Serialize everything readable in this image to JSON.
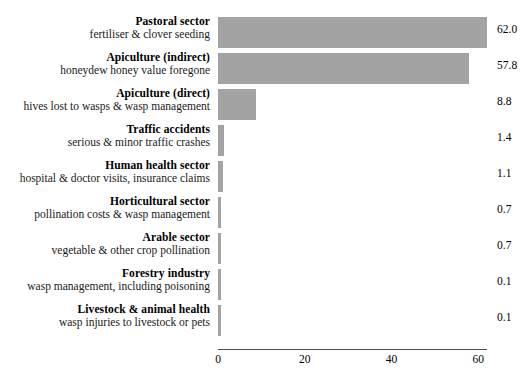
{
  "chart_data": {
    "type": "bar",
    "orientation": "horizontal",
    "title": "",
    "subtitle": "",
    "xlabel": "",
    "ylabel": "",
    "xlim": [
      0,
      62
    ],
    "xticks": [
      0,
      20,
      40,
      60
    ],
    "xtick_labels": [
      "0",
      "20",
      "40",
      "60"
    ],
    "grid": false,
    "legend": null,
    "bar_color": "#a3a3a3",
    "axis_color": "#4d4d4d",
    "text_color": "#000000",
    "categories": [
      "Pastoral sector",
      "Apiculture (indirect)",
      "Apiculture (direct)",
      "Traffic accidents",
      "Human health sector",
      "Horticultural sector",
      "Arable sector",
      "Forestry industry",
      "Livestock & animal health"
    ],
    "subcategories": [
      "fertiliser & clover seeding",
      "honeydew honey value foregone",
      "hives lost to wasps & wasp management",
      "serious & minor traffic crashes",
      "hospital & doctor visits, insurance claims",
      "pollination costs & wasp management",
      "vegetable & other crop pollination",
      "wasp management, including poisoning",
      "wasp injuries to livestock or pets"
    ],
    "values": [
      62.0,
      57.8,
      8.8,
      1.4,
      1.1,
      0.7,
      0.7,
      0.1,
      0.1
    ],
    "value_labels": [
      "62.0",
      "57.8",
      "8.8",
      "1.4",
      "1.1",
      "0.7",
      "0.7",
      "0.1",
      "0.1"
    ],
    "rows": [
      {
        "title": "Pastoral sector",
        "subtitle": "fertiliser & clover seeding",
        "value": 62.0,
        "value_label": "62.0"
      },
      {
        "title": "Apiculture (indirect)",
        "subtitle": "honeydew honey value foregone",
        "value": 57.8,
        "value_label": "57.8"
      },
      {
        "title": "Apiculture (direct)",
        "subtitle": "hives lost to wasps & wasp management",
        "value": 8.8,
        "value_label": "8.8"
      },
      {
        "title": "Traffic accidents",
        "subtitle": "serious & minor traffic crashes",
        "value": 1.4,
        "value_label": "1.4"
      },
      {
        "title": "Human health sector",
        "subtitle": "hospital & doctor visits, insurance claims",
        "value": 1.1,
        "value_label": "1.1"
      },
      {
        "title": "Horticultural sector",
        "subtitle": "pollination costs & wasp management",
        "value": 0.7,
        "value_label": "0.7"
      },
      {
        "title": "Arable sector",
        "subtitle": "vegetable & other crop pollination",
        "value": 0.7,
        "value_label": "0.7"
      },
      {
        "title": "Forestry industry",
        "subtitle": "wasp management, including poisoning",
        "value": 0.1,
        "value_label": "0.1"
      },
      {
        "title": "Livestock & animal health",
        "subtitle": "wasp injuries to livestock or pets",
        "value": 0.1,
        "value_label": "0.1"
      }
    ]
  }
}
